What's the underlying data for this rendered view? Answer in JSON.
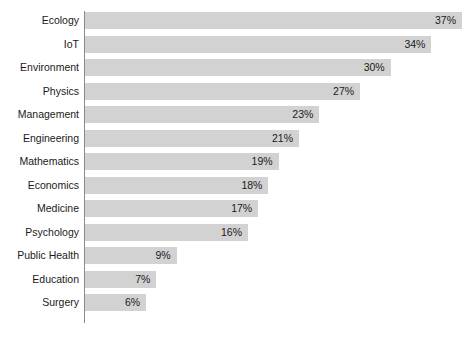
{
  "chart_data": {
    "type": "bar",
    "orientation": "horizontal",
    "title": "",
    "subtitle": "",
    "xlabel": "",
    "ylabel": "",
    "xlim": [
      0,
      39
    ],
    "grid": false,
    "legend": null,
    "value_suffix": "%",
    "bar_color": "#d2d2d2",
    "axis_color": "#8a8a8a",
    "text_color": "#1a1a1a",
    "categories": [
      "Ecology",
      "IoT",
      "Environment",
      "Physics",
      "Management",
      "Engineering",
      "Mathematics",
      "Economics",
      "Medicine",
      "Psychology",
      "Public Health",
      "Education",
      "Surgery"
    ],
    "values": [
      37,
      34,
      30,
      27,
      23,
      21,
      19,
      18,
      17,
      16,
      9,
      7,
      6
    ],
    "value_labels": [
      "37%",
      "34%",
      "30%",
      "27%",
      "23%",
      "21%",
      "19%",
      "18%",
      "17%",
      "16%",
      "9%",
      "7%",
      "6%"
    ],
    "bars": [
      {
        "category": "Ecology",
        "value": 37,
        "label": "37%"
      },
      {
        "category": "IoT",
        "value": 34,
        "label": "34%"
      },
      {
        "category": "Environment",
        "value": 30,
        "label": "30%"
      },
      {
        "category": "Physics",
        "value": 27,
        "label": "27%"
      },
      {
        "category": "Management",
        "value": 23,
        "label": "23%"
      },
      {
        "category": "Engineering",
        "value": 21,
        "label": "21%"
      },
      {
        "category": "Mathematics",
        "value": 19,
        "label": "19%"
      },
      {
        "category": "Economics",
        "value": 18,
        "label": "18%"
      },
      {
        "category": "Medicine",
        "value": 17,
        "label": "17%"
      },
      {
        "category": "Psychology",
        "value": 16,
        "label": "16%"
      },
      {
        "category": "Public Health",
        "value": 9,
        "label": "9%"
      },
      {
        "category": "Education",
        "value": 7,
        "label": "7%"
      },
      {
        "category": "Surgery",
        "value": 6,
        "label": "6%"
      }
    ]
  },
  "layout": {
    "plot_left": 85,
    "plot_top": 12,
    "plot_width_px": 377,
    "bar_height_px": 17,
    "bar_pitch_px": 23.5,
    "max_value": 37
  }
}
